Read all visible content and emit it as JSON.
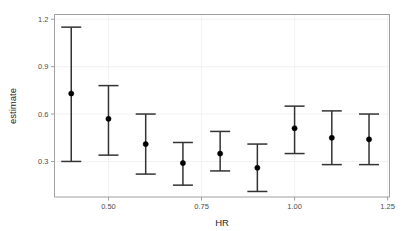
{
  "chart_data": {
    "type": "scatter",
    "title": "",
    "subtitle": "",
    "xlabel": "HR",
    "ylabel": "estimate",
    "x": [
      0.4,
      0.5,
      0.6,
      0.7,
      0.8,
      0.9,
      1.0,
      1.1,
      1.2
    ],
    "values": [
      0.73,
      0.57,
      0.41,
      0.29,
      0.35,
      0.26,
      0.51,
      0.45,
      0.44
    ],
    "error_low": [
      0.3,
      0.34,
      0.22,
      0.15,
      0.24,
      0.11,
      0.35,
      0.28,
      0.28
    ],
    "error_high": [
      1.15,
      0.78,
      0.6,
      0.42,
      0.49,
      0.41,
      0.65,
      0.62,
      0.6
    ],
    "series": [
      {
        "name": "estimate",
        "points": [
          {
            "x": 0.4,
            "y": 0.73,
            "lower": 0.3,
            "upper": 1.15
          },
          {
            "x": 0.5,
            "y": 0.57,
            "lower": 0.34,
            "upper": 0.78
          },
          {
            "x": 0.6,
            "y": 0.41,
            "lower": 0.22,
            "upper": 0.6
          },
          {
            "x": 0.7,
            "y": 0.29,
            "lower": 0.15,
            "upper": 0.42
          },
          {
            "x": 0.8,
            "y": 0.35,
            "lower": 0.24,
            "upper": 0.49
          },
          {
            "x": 0.9,
            "y": 0.26,
            "lower": 0.11,
            "upper": 0.41
          },
          {
            "x": 1.0,
            "y": 0.51,
            "lower": 0.35,
            "upper": 0.65
          },
          {
            "x": 1.1,
            "y": 0.45,
            "lower": 0.28,
            "upper": 0.62
          },
          {
            "x": 1.2,
            "y": 0.44,
            "lower": 0.28,
            "upper": 0.6
          }
        ]
      }
    ],
    "xticks": [
      0.5,
      0.75,
      1.0,
      1.25
    ],
    "xtick_labels": [
      "0.50",
      "0.75",
      "1.00",
      "1.25"
    ],
    "yticks": [
      0.3,
      0.6,
      0.9,
      1.2
    ],
    "ytick_labels": [
      "0.3",
      "0.6",
      "0.9",
      "1.2"
    ],
    "xlim": [
      0.355,
      1.255
    ],
    "ylim": [
      0.075,
      1.23
    ],
    "grid": true,
    "legend": null,
    "marker": "filled-circle",
    "errorbar_style": "capped-vertical",
    "colors": {
      "point": "#000000",
      "errorbar": "#333333",
      "panel_border": "#a0a0a0",
      "grid": "#f2f2f2",
      "axis_text": "#4d4d4d",
      "axis_title": "#262626",
      "background": "#ffffff"
    }
  },
  "axis": {
    "x_title": "HR",
    "y_title": "estimate"
  }
}
